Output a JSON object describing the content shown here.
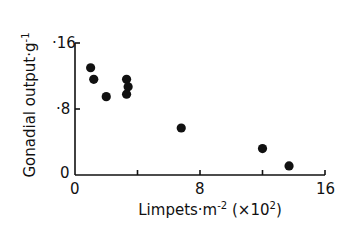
{
  "chart_data": {
    "type": "scatter",
    "title": "",
    "xlabel": "Limpets·m⁻² (×10²)",
    "ylabel": "Gonadial output·g⁻¹",
    "xlim": [
      0,
      16
    ],
    "ylim": [
      0,
      0.16
    ],
    "x_ticks": [
      0,
      4,
      8,
      12,
      16
    ],
    "x_tick_labels": [
      "0",
      "",
      "8",
      "",
      "16"
    ],
    "y_ticks": [
      0,
      0.08,
      0.16
    ],
    "y_tick_labels": [
      "0",
      "·8",
      "·16"
    ],
    "grid": false,
    "legend": null,
    "series": [
      {
        "name": "observations",
        "points": [
          {
            "x": 1.0,
            "y": 0.13
          },
          {
            "x": 1.2,
            "y": 0.116
          },
          {
            "x": 2.0,
            "y": 0.095
          },
          {
            "x": 3.3,
            "y": 0.116
          },
          {
            "x": 3.4,
            "y": 0.107
          },
          {
            "x": 3.3,
            "y": 0.098
          },
          {
            "x": 6.8,
            "y": 0.057
          },
          {
            "x": 12.0,
            "y": 0.032
          },
          {
            "x": 13.7,
            "y": 0.011
          }
        ]
      }
    ]
  },
  "axes": {
    "y_label_main": "Gonadial output·g",
    "y_label_sup": "-1",
    "x_label_main": "Limpets·m",
    "x_label_sup": "-2",
    "x_label_mult": " (×10",
    "x_label_mult_sup": "2",
    "x_label_close": ")",
    "y_tick_top": "·16",
    "y_tick_mid": "·8",
    "y_tick_zero": "0",
    "x_tick_zero": "0",
    "x_tick_mid": "8",
    "x_tick_max": "16"
  },
  "style": {
    "ink": "#111111",
    "background": "#ffffff"
  }
}
